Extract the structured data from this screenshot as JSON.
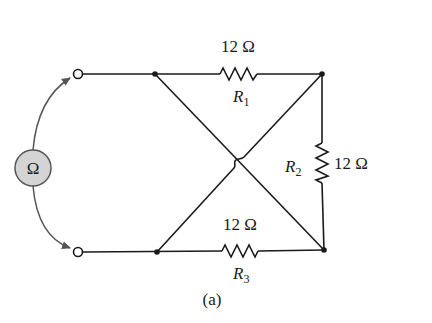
{
  "diagram": {
    "caption": "(a)",
    "meter": {
      "symbol": "Ω",
      "name": "ohmmeter",
      "fill": "#d4d4d4"
    },
    "resistors": [
      {
        "id": "R1",
        "letter": "R",
        "sub": "1",
        "value": "12 Ω",
        "position": "top"
      },
      {
        "id": "R2",
        "letter": "R",
        "sub": "2",
        "value": "12 Ω",
        "position": "right"
      },
      {
        "id": "R3",
        "letter": "R",
        "sub": "3",
        "value": "12 Ω",
        "position": "bottom"
      }
    ],
    "colors": {
      "wire": "#1a1a1a",
      "lead": "#555555",
      "meter_fill": "#d4d4d4"
    }
  }
}
